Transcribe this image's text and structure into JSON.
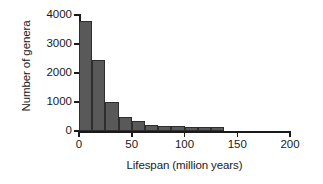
{
  "chart_data": {
    "type": "bar",
    "title": "",
    "subtitle": "",
    "xlabel": "Lifespan (million years)",
    "ylabel": "Number of genera",
    "xlim": [
      0,
      200
    ],
    "ylim": [
      0,
      4000
    ],
    "xticks": [
      0,
      50,
      100,
      150,
      200
    ],
    "xtick_labels": [
      "0",
      "50",
      "100",
      "150",
      "200"
    ],
    "yticks": [
      0,
      1000,
      2000,
      3000,
      4000
    ],
    "ytick_labels": [
      "0",
      "1000",
      "2000",
      "3000",
      "4000"
    ],
    "grid": false,
    "legend": false,
    "legend_position": "none",
    "bin_width": 12.5,
    "bar_color": "#595959",
    "bar_edge_color": "#2e2e2e",
    "axis_color": "#1a1a1a",
    "background_color": "#ffffff",
    "bin_starts": [
      0,
      12.5,
      25,
      37.5,
      50,
      62.5,
      75,
      87.5,
      100,
      112.5,
      125
    ],
    "categories": [
      "0-12.5",
      "12.5-25",
      "25-37.5",
      "37.5-50",
      "50-62.5",
      "62.5-75",
      "75-87.5",
      "87.5-100",
      "100-112.5",
      "112.5-125",
      "125-137.5"
    ],
    "values": [
      3800,
      2450,
      1000,
      500,
      330,
      200,
      180,
      170,
      130,
      140,
      150
    ]
  }
}
